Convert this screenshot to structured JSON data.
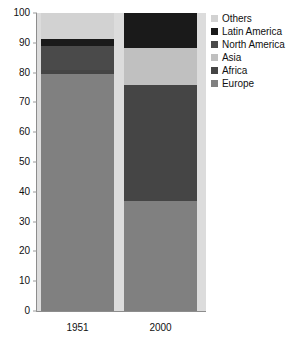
{
  "chart_data": {
    "type": "bar",
    "stacked": true,
    "title": "",
    "subtitle": "",
    "xlabel": "",
    "ylabel": "",
    "categories": [
      "1951",
      "2000"
    ],
    "ylim": [
      0,
      100
    ],
    "yticks": [
      0,
      10,
      20,
      30,
      40,
      50,
      60,
      70,
      80,
      90,
      100
    ],
    "ytick_labels": [
      "0",
      "10",
      "20",
      "30",
      "40",
      "50",
      "60",
      "70",
      "80",
      "90",
      "100"
    ],
    "grid": false,
    "legend_position": "right",
    "series": [
      {
        "name": "Others",
        "color": "#d2d2d2",
        "values": [
          8.7,
          0.0
        ]
      },
      {
        "name": "Latin America",
        "color": "#1a1a1a",
        "values": [
          2.3,
          11.7
        ]
      },
      {
        "name": "North America",
        "color": "#4a4a4a",
        "values": [
          8.0,
          0.0
        ]
      },
      {
        "name": "Asia",
        "color": "#c0c0c0",
        "values": [
          0.0,
          12.3
        ]
      },
      {
        "name": "Africa",
        "color": "#454545",
        "values": [
          1.5,
          39.2
        ]
      },
      {
        "name": "Europe",
        "color": "#808080",
        "values": [
          79.5,
          36.8
        ]
      }
    ],
    "stack_order_bottom_to_top": [
      "Europe",
      "Africa",
      "Asia",
      "North America",
      "Latin America",
      "Others"
    ],
    "plot_background": "#dcdcdc",
    "axis_color": "#8d8d8d"
  },
  "legend": {
    "items": [
      {
        "label": "Others"
      },
      {
        "label": "Latin America"
      },
      {
        "label": "North America"
      },
      {
        "label": "Asia"
      },
      {
        "label": "Africa"
      },
      {
        "label": "Europe"
      }
    ]
  },
  "y_axis": {
    "ticks": [
      {
        "label": "100"
      },
      {
        "label": "90"
      },
      {
        "label": "80"
      },
      {
        "label": "70"
      },
      {
        "label": "60"
      },
      {
        "label": "50"
      },
      {
        "label": "40"
      },
      {
        "label": "30"
      },
      {
        "label": "20"
      },
      {
        "label": "10"
      },
      {
        "label": "0"
      }
    ]
  },
  "x_axis": {
    "categories": [
      {
        "label": "1951"
      },
      {
        "label": "2000"
      }
    ]
  }
}
